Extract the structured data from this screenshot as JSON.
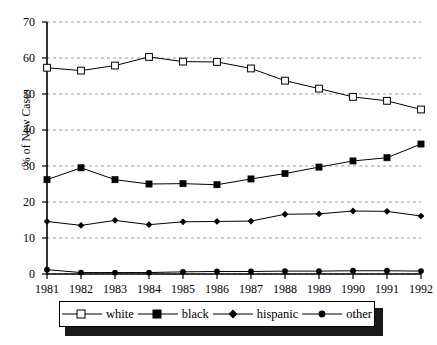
{
  "chart_data": {
    "type": "line",
    "title": "",
    "subtitle": "",
    "xlabel": "",
    "ylabel": "% of New Cases",
    "categories": [
      "1981",
      "1982",
      "1983",
      "1984",
      "1985",
      "1986",
      "1987",
      "1988",
      "1989",
      "1990",
      "1991",
      "1992"
    ],
    "x": [
      1981,
      1982,
      1983,
      1984,
      1985,
      1986,
      1987,
      1988,
      1989,
      1990,
      1991,
      1992
    ],
    "xlim": [
      1981,
      1992
    ],
    "ylim": [
      0,
      70
    ],
    "ytick_labels": [
      "0",
      "10",
      "20",
      "30",
      "40",
      "50",
      "60",
      "70"
    ],
    "yticks": [
      0,
      10,
      20,
      30,
      40,
      50,
      60,
      70
    ],
    "grid": "horizontal-dashed",
    "legend_position": "bottom",
    "series": [
      {
        "name": "white",
        "marker": "open-square",
        "values": [
          57.3,
          56.5,
          57.9,
          60.3,
          59.0,
          58.9,
          57.1,
          53.7,
          51.5,
          49.2,
          48.1,
          45.7
        ]
      },
      {
        "name": "black",
        "marker": "filled-square",
        "values": [
          26.2,
          29.5,
          26.2,
          25.0,
          25.1,
          24.8,
          26.4,
          27.9,
          29.7,
          31.4,
          32.3,
          36.1
        ]
      },
      {
        "name": "hispanic",
        "marker": "filled-diamond",
        "values": [
          14.6,
          13.5,
          14.9,
          13.7,
          14.5,
          14.6,
          14.7,
          16.6,
          16.7,
          17.5,
          17.4,
          16.1
        ]
      },
      {
        "name": "other",
        "marker": "filled-circle",
        "values": [
          1.2,
          0.4,
          0.4,
          0.4,
          0.6,
          0.7,
          0.7,
          0.8,
          0.8,
          0.9,
          0.9,
          0.8
        ]
      }
    ]
  },
  "legend": {
    "entries": [
      {
        "label": "white"
      },
      {
        "label": "black"
      },
      {
        "label": "hispanic"
      },
      {
        "label": "other"
      }
    ]
  },
  "axis": {
    "y_label": "% of New Cases"
  }
}
